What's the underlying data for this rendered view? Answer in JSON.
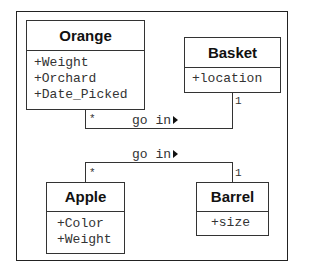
{
  "diagram": {
    "type": "uml-class",
    "classes": [
      {
        "name": "Orange",
        "attributes": [
          "+Weight",
          "+Orchard",
          "+Date_Picked"
        ]
      },
      {
        "name": "Basket",
        "attributes": [
          "+location"
        ]
      },
      {
        "name": "Apple",
        "attributes": [
          "+Color",
          "+Weight"
        ]
      },
      {
        "name": "Barrel",
        "attributes": [
          "+size"
        ]
      }
    ],
    "associations": [
      {
        "from": "Orange",
        "to": "Basket",
        "label": "go in",
        "from_multiplicity": "*",
        "to_multiplicity": "1"
      },
      {
        "from": "Apple",
        "to": "Barrel",
        "label": "go in",
        "from_multiplicity": "*",
        "to_multiplicity": "1"
      }
    ]
  }
}
